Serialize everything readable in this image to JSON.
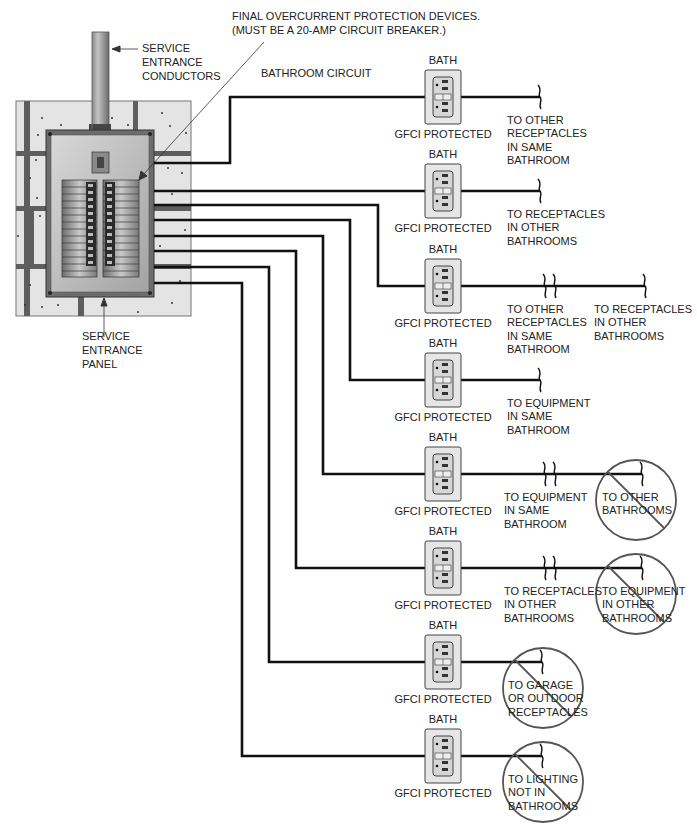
{
  "diagram": {
    "title_callout": {
      "line1": "FINAL OVERCURRENT PROTECTION DEVICES.",
      "line2": "(MUST BE A 20-AMP CIRCUIT BREAKER.)"
    },
    "service_entrance_conductors": {
      "line1": "SERVICE",
      "line2": "ENTRANCE",
      "line3": "CONDUCTORS"
    },
    "service_entrance_panel": {
      "line1": "SERVICE",
      "line2": "ENTRANCE",
      "line3": "PANEL"
    },
    "circuit_label": "BATHROOM CIRCUIT",
    "colors": {
      "wire": "#111111",
      "wall": "#e4e4e4",
      "stud": "#5e5e5e",
      "panel": "#b9b9b9",
      "plate": "#e6e6e6",
      "prohibit": "#555555"
    },
    "receptacles": [
      {
        "top_label": "BATH",
        "bottom_label": "GFCI PROTECTED",
        "y": 97,
        "destinations": [
          {
            "lines": [
              "TO OTHER",
              "RECEPTACLES",
              "IN SAME",
              "BATHROOM"
            ],
            "prohibited": false
          }
        ]
      },
      {
        "top_label": "BATH",
        "bottom_label": "GFCI PROTECTED",
        "y": 191,
        "destinations": [
          {
            "lines": [
              "TO RECEPTACLES",
              "IN OTHER",
              "BATHROOMS"
            ],
            "prohibited": false
          }
        ]
      },
      {
        "top_label": "BATH",
        "bottom_label": "GFCI PROTECTED",
        "y": 286,
        "destinations": [
          {
            "lines": [
              "TO OTHER",
              "RECEPTACLES",
              "IN SAME",
              "BATHROOM"
            ],
            "prohibited": false
          },
          {
            "lines": [
              "TO RECEPTACLES",
              "IN OTHER",
              "BATHROOMS"
            ],
            "prohibited": false
          }
        ]
      },
      {
        "top_label": "BATH",
        "bottom_label": "GFCI PROTECTED",
        "y": 380,
        "destinations": [
          {
            "lines": [
              "TO EQUIPMENT",
              "IN SAME",
              "BATHROOM"
            ],
            "prohibited": false
          }
        ]
      },
      {
        "top_label": "BATH",
        "bottom_label": "GFCI PROTECTED",
        "y": 474,
        "destinations": [
          {
            "lines": [
              "TO EQUIPMENT",
              "IN SAME",
              "BATHROOM"
            ],
            "prohibited": false
          },
          {
            "lines": [
              "TO OTHER",
              "BATHROOMS"
            ],
            "prohibited": true
          }
        ]
      },
      {
        "top_label": "BATH",
        "bottom_label": "GFCI PROTECTED",
        "y": 568,
        "destinations": [
          {
            "lines": [
              "TO RECEPTACLES",
              "IN OTHER",
              "BATHROOMS"
            ],
            "prohibited": false
          },
          {
            "lines": [
              "TO EQUIPMENT",
              "IN OTHER",
              "BATHROOMS"
            ],
            "prohibited": true
          }
        ]
      },
      {
        "top_label": "BATH",
        "bottom_label": "GFCI PROTECTED",
        "y": 662,
        "destinations": [
          {
            "lines": [
              "TO GARAGE",
              "OR OUTDOOR",
              "RECEPTACLES"
            ],
            "prohibited": true
          }
        ]
      },
      {
        "top_label": "BATH",
        "bottom_label": "GFCI PROTECTED",
        "y": 756,
        "destinations": [
          {
            "lines": [
              "TO LIGHTING",
              "NOT IN",
              "BATHROOMS"
            ],
            "prohibited": true
          }
        ]
      }
    ]
  }
}
